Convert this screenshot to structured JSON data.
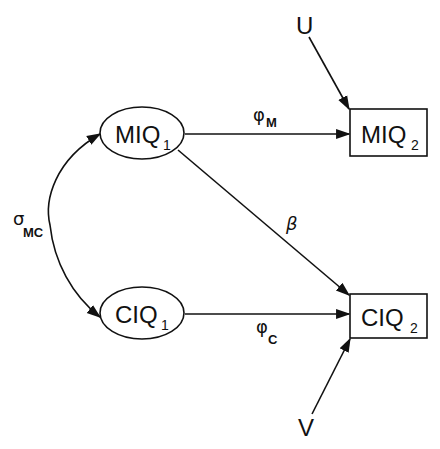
{
  "diagram": {
    "type": "path-diagram",
    "colors": {
      "stroke": "#111111",
      "background": "#ffffff"
    },
    "nodes": {
      "miq1": {
        "label": "MIQ",
        "sub": "1",
        "shape": "ellipse"
      },
      "ciq1": {
        "label": "CIQ",
        "sub": "1",
        "shape": "ellipse"
      },
      "miq2": {
        "label": "MIQ",
        "sub": "2",
        "shape": "rectangle"
      },
      "ciq2": {
        "label": "CIQ",
        "sub": "2",
        "shape": "rectangle"
      },
      "u": {
        "label": "U",
        "shape": "none"
      },
      "v": {
        "label": "V",
        "shape": "none"
      }
    },
    "edges": {
      "phi_m": {
        "from": "MIQ1",
        "to": "MIQ2",
        "symbol": "φ",
        "sub": "M"
      },
      "phi_c": {
        "from": "CIQ1",
        "to": "CIQ2",
        "symbol": "φ",
        "sub": "C"
      },
      "beta": {
        "from": "MIQ1",
        "to": "CIQ2",
        "symbol": "β"
      },
      "sigma_mc": {
        "between": [
          "MIQ1",
          "CIQ1"
        ],
        "symbol": "σ",
        "sub": "MC",
        "type": "covariance"
      },
      "u_edge": {
        "from": "U",
        "to": "MIQ2"
      },
      "v_edge": {
        "from": "V",
        "to": "CIQ2"
      }
    }
  }
}
